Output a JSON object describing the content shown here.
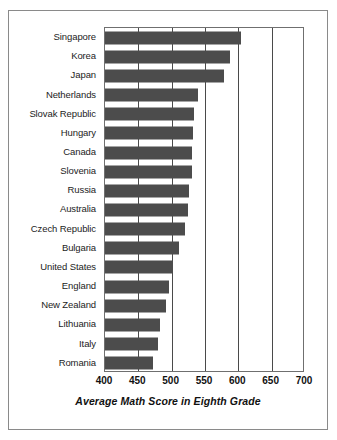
{
  "chart_data": {
    "type": "bar",
    "orientation": "horizontal",
    "title": "",
    "xlabel": "Average Math Score in Eighth Grade",
    "ylabel": "",
    "xlim": [
      400,
      700
    ],
    "xticks": [
      400,
      450,
      500,
      550,
      600,
      650,
      700
    ],
    "grid": true,
    "legend": false,
    "bar_color": "#4c4c4c",
    "categories": [
      "Singapore",
      "Korea",
      "Japan",
      "Netherlands",
      "Slovak Republic",
      "Hungary",
      "Canada",
      "Slovenia",
      "Russia",
      "Australia",
      "Czech Republic",
      "Bulgaria",
      "United States",
      "England",
      "New Zealand",
      "Lithuania",
      "Italy",
      "Romania"
    ],
    "values": [
      604,
      587,
      579,
      540,
      534,
      532,
      531,
      530,
      526,
      525,
      520,
      511,
      502,
      496,
      491,
      482,
      479,
      472
    ]
  },
  "axis": {
    "tick_labels": [
      "400",
      "450",
      "500",
      "550",
      "600",
      "650",
      "700"
    ],
    "x_title": "Average Math Score in Eighth Grade"
  }
}
